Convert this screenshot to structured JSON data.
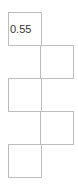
{
  "cells": [
    {
      "value": "0.55"
    },
    {
      "value": ""
    },
    {
      "value": ""
    },
    {
      "value": ""
    },
    {
      "value": ""
    }
  ],
  "colors": {
    "border": "#bdbdbd",
    "text": "#333333",
    "background": "#ffffff"
  }
}
